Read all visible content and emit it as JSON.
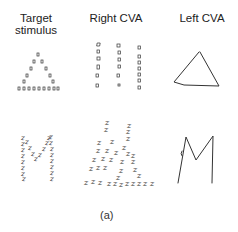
{
  "columns": [
    {
      "id": "target",
      "label_line1": "Target",
      "label_line2": "stimulus"
    },
    {
      "id": "right_cva",
      "label": "Right CVA"
    },
    {
      "id": "left_cva",
      "label": "Left CVA"
    }
  ],
  "rows": [
    {
      "id": "row1",
      "global_shape": "triangle",
      "local_element": "small square",
      "target": "triangle composed of small squares",
      "right_cva": "three vertical columns of small squares (local elements preserved, global shape lost)",
      "left_cva": "single line-drawn triangle (global shape preserved, local elements lost)"
    },
    {
      "id": "row2",
      "global_shape": "M",
      "local_element": "Z",
      "target": "letter M composed of small Z letters",
      "right_cva": "scattered cluster of Z letters (local elements preserved, global shape lost)",
      "left_cva": "single line-drawn M (global shape preserved, local elements lost)"
    }
  ],
  "local_glyph": "z",
  "caption": "(a)"
}
